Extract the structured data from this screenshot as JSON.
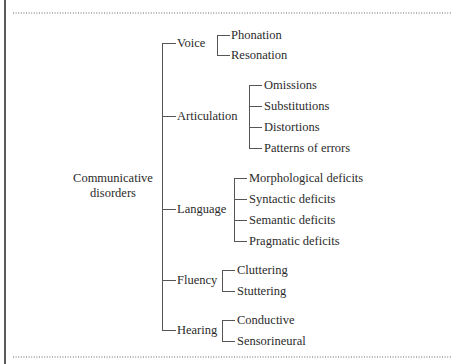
{
  "diagram": {
    "root": {
      "label_lines": [
        "Communicative",
        "disorders"
      ]
    },
    "branches": [
      {
        "label": "Voice",
        "children": [
          "Phonation",
          "Resonation"
        ]
      },
      {
        "label": "Articulation",
        "children": [
          "Omissions",
          "Substitutions",
          "Distortions",
          "Patterns of errors"
        ]
      },
      {
        "label": "Language",
        "children": [
          "Morphological deficits",
          "Syntactic deficits",
          "Semantic deficits",
          "Pragmatic deficits"
        ]
      },
      {
        "label": "Fluency",
        "children": [
          "Cluttering",
          "Stuttering"
        ]
      },
      {
        "label": "Hearing",
        "children": [
          "Conductive",
          "Sensorineural"
        ]
      }
    ]
  }
}
